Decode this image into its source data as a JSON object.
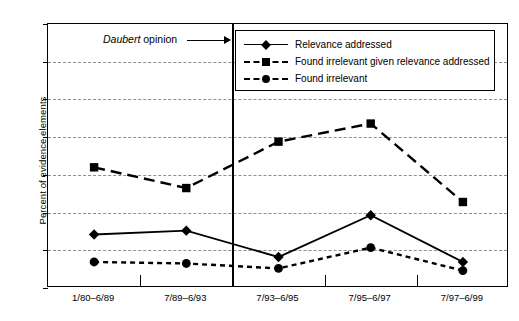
{
  "chart_data": {
    "type": "line",
    "title": "",
    "xlabel": "",
    "ylabel": "Percent of evidence elements",
    "categories": [
      "1/80–6/89",
      "7/89–6/93",
      "7/93–6/95",
      "7/95–6/97",
      "7/97–6/99"
    ],
    "ylim": [
      0,
      70
    ],
    "yticks": [
      0,
      10,
      20,
      30,
      40,
      50,
      60,
      70
    ],
    "grid": "horizontal-dashed",
    "legend_position": "top-right",
    "series": [
      {
        "name": "Relevance addressed",
        "marker": "diamond",
        "line": "solid",
        "values": [
          14.2,
          15.2,
          8.2,
          19.3,
          6.9
        ]
      },
      {
        "name": "Found irrelevant given relevance addressed",
        "marker": "square",
        "line": "dashed",
        "values": [
          32.0,
          26.5,
          38.8,
          43.6,
          22.8
        ]
      },
      {
        "name": "Found irrelevant",
        "marker": "circle",
        "line": "dotted",
        "values": [
          6.9,
          6.5,
          5.2,
          10.7,
          4.6
        ]
      }
    ],
    "annotations": [
      {
        "text_italic": "Daubert",
        "text_plain": " opinion",
        "arrow": "right-arrow",
        "target": "vertical-divider-between-7/89-6/93-and-7/93-6/95"
      }
    ],
    "divider": {
      "after_category_index": 1,
      "style": "solid-vertical"
    },
    "colors": {
      "line": "#000000",
      "grid": "#8e8e8e",
      "axis": "#000000",
      "background": "#ffffff"
    }
  }
}
